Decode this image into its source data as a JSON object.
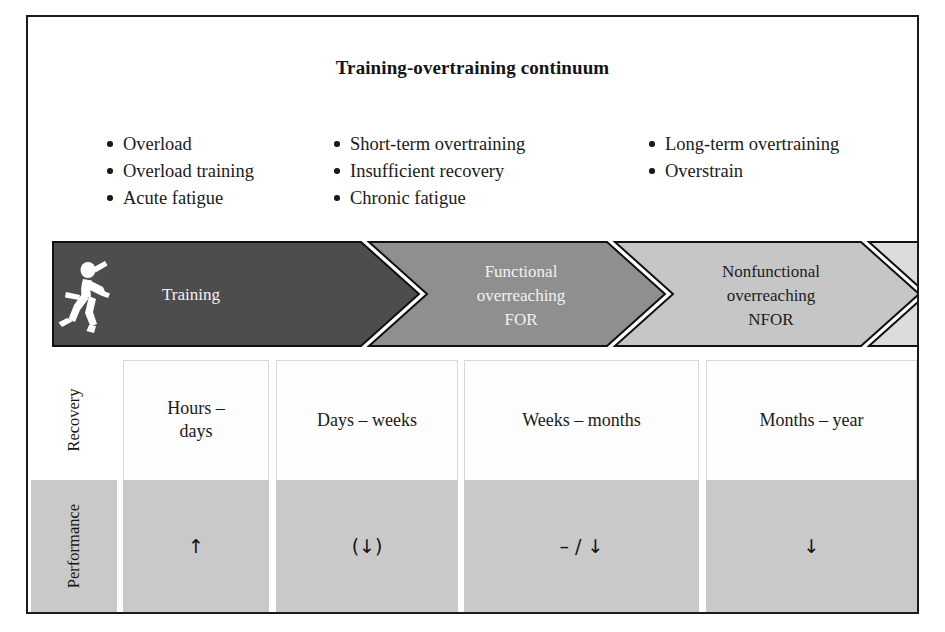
{
  "figure": {
    "title": "Training-overtraining continuum"
  },
  "bullet_columns": [
    {
      "name": "training-stage-terms",
      "items": [
        "Overload",
        "Overload training",
        "Acute fatigue"
      ]
    },
    {
      "name": "functional-overreaching-terms",
      "items": [
        "Short-term overtraining",
        "Insufficient recovery",
        "Chronic fatigue"
      ]
    },
    {
      "name": "overtraining-terms",
      "items": [
        "Long-term overtraining",
        "Overstrain"
      ]
    }
  ],
  "continuum": {
    "stages": [
      {
        "id": "training",
        "lines": [
          "Training"
        ],
        "fill": "#4d4d4d",
        "text_color": "#f2f2f2",
        "icon": "runner-icon"
      },
      {
        "id": "functional-overreaching",
        "lines": [
          "Functional",
          "overreaching",
          "FOR"
        ],
        "fill": "#8f8f8f",
        "text_color": "#f2f2f2",
        "icon": ""
      },
      {
        "id": "nonfunctional-overreaching",
        "lines": [
          "Nonfunctional",
          "overreaching",
          "NFOR"
        ],
        "fill": "#c6c6c6",
        "text_color": "#1c1c1c",
        "icon": ""
      },
      {
        "id": "overtraining-syndrome",
        "lines": [
          "Overtraining",
          "syndrome",
          "OTS"
        ],
        "fill": "#dcdcdc",
        "text_color": "#1c1c1c",
        "icon": ""
      }
    ]
  },
  "outcome_table": {
    "row_labels": [
      "Recovery",
      "Performance"
    ],
    "columns": [
      {
        "id": "training",
        "recovery": "Hours –\ndays",
        "recovery_lines": [
          "Hours –",
          "days"
        ],
        "performance": "↑"
      },
      {
        "id": "for",
        "recovery": "Days – weeks",
        "recovery_lines": [
          "Days – weeks"
        ],
        "performance": "(↓)"
      },
      {
        "id": "nfor",
        "recovery": "Weeks – months",
        "recovery_lines": [
          "Weeks – months"
        ],
        "performance": "– / ↓"
      },
      {
        "id": "ots",
        "recovery": "Months – year",
        "recovery_lines": [
          "Months – year"
        ],
        "performance": "↓"
      }
    ]
  },
  "colors": {
    "frame": "#1b1b1b",
    "performance_row": "#c9c9c9",
    "recovery_row": "#fdfdfd",
    "stage_1": "#4d4d4d",
    "stage_2": "#8f8f8f",
    "stage_3": "#c6c6c6",
    "stage_4": "#dcdcdc"
  }
}
